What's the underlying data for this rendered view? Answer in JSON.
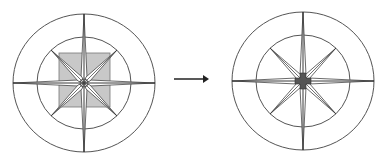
{
  "diagram": {
    "left_figure": {
      "name": "compass-rose-before",
      "center": [
        84,
        83
      ],
      "outer_radius": [
        71,
        69
      ],
      "inner_radius": [
        47,
        46
      ],
      "center_shape": "square",
      "square": {
        "x": 59,
        "y": 53,
        "w": 51,
        "h": 54,
        "fill": "#c8c8c8"
      }
    },
    "right_figure": {
      "name": "compass-rose-after",
      "center": [
        303,
        81
      ],
      "outer_radius": [
        71,
        69
      ],
      "inner_radius": [
        47,
        46
      ],
      "center_shape": "cross",
      "cross_fill": "#555555"
    },
    "arrow": {
      "name": "transform-arrow",
      "from": [
        174,
        79
      ],
      "to": [
        208,
        79
      ]
    },
    "colors": {
      "stroke": "#333333",
      "circle_stroke": "#555555",
      "square_fill": "#c8c8c8",
      "cross_fill": "#555555"
    }
  }
}
